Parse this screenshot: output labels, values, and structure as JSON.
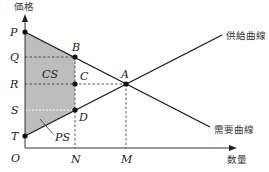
{
  "diagram": {
    "axes": {
      "y_label": "価格",
      "x_label": "数量",
      "origin_label": "O"
    },
    "curves": {
      "supply_label": "供給曲線",
      "demand_label": "需要曲線"
    },
    "price_labels": [
      "P",
      "Q",
      "R",
      "S",
      "T"
    ],
    "quantity_labels": [
      "N",
      "M"
    ],
    "points": {
      "A": "A",
      "B": "B",
      "C": "C",
      "D": "D"
    },
    "areas": {
      "consumer_surplus": "CS",
      "producer_surplus": "PS"
    },
    "colors": {
      "shade": "#b9b9b9",
      "line": "#1a1a1a",
      "dash": "#444444"
    }
  }
}
